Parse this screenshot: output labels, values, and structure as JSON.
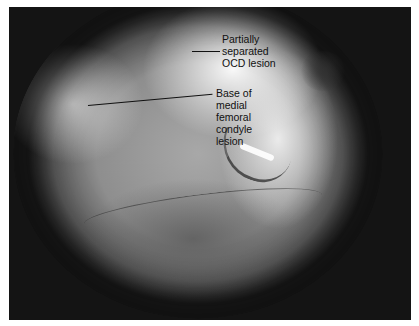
{
  "figure": {
    "color_mode": "grayscale",
    "frame_color": "#141414",
    "annotations": [
      {
        "id": "ocd-lesion",
        "label": "Partially\nseparated\nOCD lesion"
      },
      {
        "id": "mfc-base",
        "label": "Base of\nmedial\nfemoral\ncondyle\nlesion"
      }
    ]
  }
}
